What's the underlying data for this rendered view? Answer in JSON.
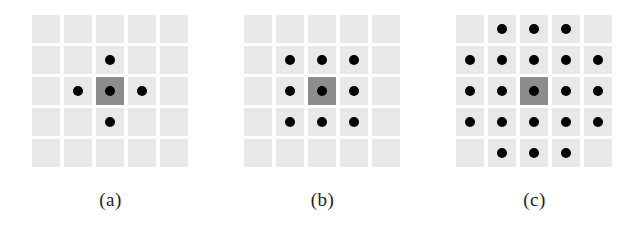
{
  "figure": {
    "grid_size": 5,
    "colors": {
      "cell": "#e8e8e8",
      "center_cell": "#8d8d8d",
      "dot": "#000000"
    },
    "panels": [
      {
        "id": "a",
        "caption": "(a)",
        "left": 32,
        "description": "von Neumann neighborhood (radius 1)",
        "dots": [
          [
            1,
            2
          ],
          [
            2,
            1
          ],
          [
            2,
            2
          ],
          [
            2,
            3
          ],
          [
            3,
            2
          ]
        ]
      },
      {
        "id": "b",
        "caption": "(b)",
        "left": 244,
        "description": "Moore neighborhood (3x3)",
        "dots": [
          [
            1,
            1
          ],
          [
            1,
            2
          ],
          [
            1,
            3
          ],
          [
            2,
            1
          ],
          [
            2,
            2
          ],
          [
            2,
            3
          ],
          [
            3,
            1
          ],
          [
            3,
            2
          ],
          [
            3,
            3
          ]
        ]
      },
      {
        "id": "c",
        "caption": "(c)",
        "left": 456,
        "description": "5x5 neighborhood without corners",
        "dots": [
          [
            0,
            1
          ],
          [
            0,
            2
          ],
          [
            0,
            3
          ],
          [
            1,
            0
          ],
          [
            1,
            1
          ],
          [
            1,
            2
          ],
          [
            1,
            3
          ],
          [
            1,
            4
          ],
          [
            2,
            0
          ],
          [
            2,
            1
          ],
          [
            2,
            2
          ],
          [
            2,
            3
          ],
          [
            2,
            4
          ],
          [
            3,
            0
          ],
          [
            3,
            1
          ],
          [
            3,
            2
          ],
          [
            3,
            3
          ],
          [
            3,
            4
          ],
          [
            4,
            1
          ],
          [
            4,
            2
          ],
          [
            4,
            3
          ]
        ]
      }
    ]
  }
}
